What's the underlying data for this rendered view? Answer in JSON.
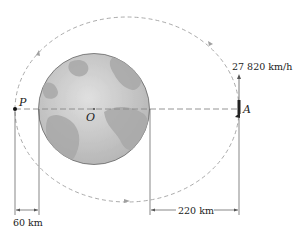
{
  "diagram": {
    "labels": {
      "perigee": "P",
      "apogee": "A",
      "center": "O",
      "velocity": "27 820 km/h",
      "perigee_altitude": "60 km",
      "apogee_altitude": "220 km"
    },
    "colors": {
      "orbit": "#9a9a9a",
      "earth_fill": "#c8c8c8",
      "earth_land": "#a9a9a9",
      "line": "#333333"
    }
  }
}
